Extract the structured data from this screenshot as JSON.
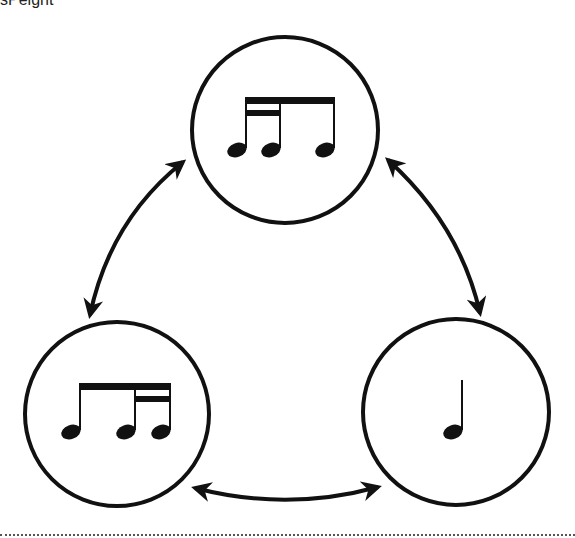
{
  "header": {
    "clipped_text": "sPeight"
  },
  "diagram": {
    "colors": {
      "stroke": "#111111",
      "background": "#ffffff"
    },
    "nodes": [
      {
        "id": "top",
        "label": "sixteenth-sixteenth-eighth",
        "cx": 285,
        "cy": 130,
        "r": 93
      },
      {
        "id": "bottom-left",
        "label": "eighth-sixteenth-sixteenth",
        "cx": 117,
        "cy": 414,
        "r": 92
      },
      {
        "id": "bottom-right",
        "label": "quarter note",
        "cx": 456,
        "cy": 412,
        "r": 93
      }
    ],
    "arrows": [
      {
        "id": "top-to-bottom-left",
        "bidirectional": true
      },
      {
        "id": "top-to-bottom-right",
        "bidirectional": true
      },
      {
        "id": "bottom-left-to-bottom-right",
        "bidirectional": true
      }
    ]
  }
}
